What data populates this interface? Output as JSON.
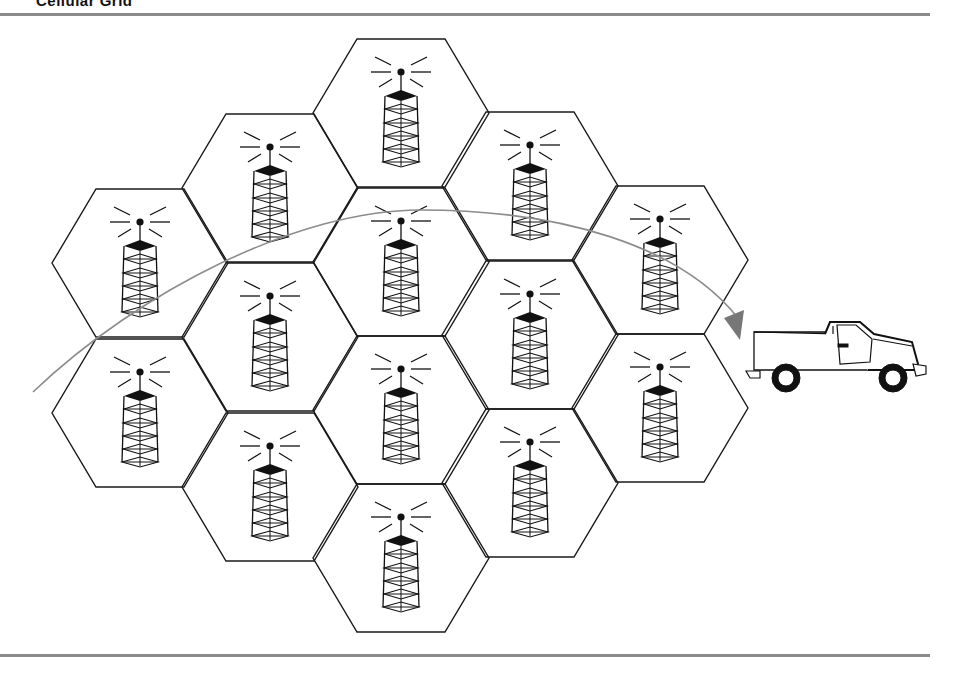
{
  "title": "Cellular Grid",
  "diagram": {
    "cells": [
      {
        "id": "c1r1",
        "cx": 140,
        "cy": 263
      },
      {
        "id": "c1r2",
        "cx": 140,
        "cy": 413
      },
      {
        "id": "c2r1",
        "cx": 270,
        "cy": 188
      },
      {
        "id": "c2r2",
        "cx": 270,
        "cy": 337
      },
      {
        "id": "c2r3",
        "cx": 270,
        "cy": 487
      },
      {
        "id": "c3r1",
        "cx": 401,
        "cy": 113
      },
      {
        "id": "c3r2",
        "cx": 401,
        "cy": 262
      },
      {
        "id": "c3r3",
        "cx": 401,
        "cy": 410
      },
      {
        "id": "c3r4",
        "cx": 401,
        "cy": 558
      },
      {
        "id": "c4r1",
        "cx": 530,
        "cy": 186
      },
      {
        "id": "c4r2",
        "cx": 530,
        "cy": 335
      },
      {
        "id": "c4r3",
        "cx": 530,
        "cy": 483
      },
      {
        "id": "c5r1",
        "cx": 660,
        "cy": 260
      },
      {
        "id": "c5r2",
        "cx": 660,
        "cy": 408
      }
    ],
    "cell_icon": "cell-tower-icon",
    "vehicle_icon": "pickup-truck-icon",
    "path_color": "#8c8c8c",
    "arrow_color": "#777777",
    "line_color": "#1a1a1a"
  }
}
